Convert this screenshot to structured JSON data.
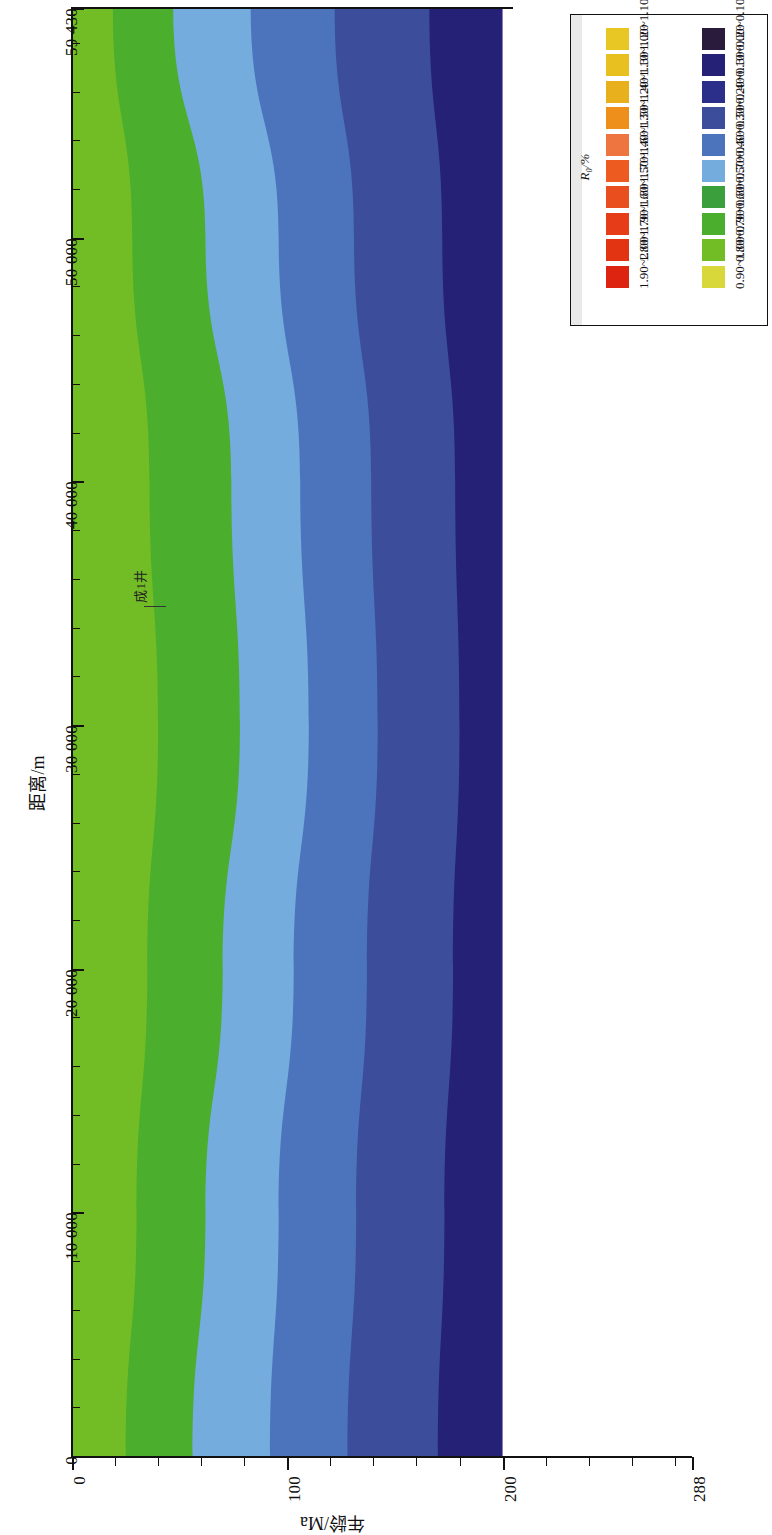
{
  "figure": {
    "kind": "filled-contour-map",
    "background": "#ffffff"
  },
  "axes": {
    "y": {
      "title": "距离/m",
      "unit": "m",
      "min": 0,
      "max": 59430,
      "tick_labels": [
        "0",
        "10 000",
        "20 000",
        "30 000",
        "40 000",
        "50 000",
        "59 430"
      ],
      "tick_values": [
        0,
        10000,
        20000,
        30000,
        40000,
        50000,
        59430
      ],
      "minor_tick_step": 2000
    },
    "x": {
      "title": "年龄/Ma",
      "unit": "Ma",
      "min": 0,
      "max": 288,
      "tick_labels": [
        "0",
        "100",
        "200",
        "288"
      ],
      "tick_values": [
        0,
        100,
        200,
        288
      ],
      "minor_tick_step": 20
    }
  },
  "annotations": [
    {
      "name": "well-marker",
      "label": "成1井",
      "distance_m": 37000
    }
  ],
  "legend": {
    "title": "R₀/%",
    "title_plain": "Ro/%",
    "columns": [
      {
        "name": "high-maturity-column",
        "entries": [
          {
            "label": "1.00~1.10",
            "color": "#E8C623"
          },
          {
            "label": "1.10~1.20",
            "color": "#E8C020"
          },
          {
            "label": "1.20~1.30",
            "color": "#E7B01C"
          },
          {
            "label": "1.30~1.40",
            "color": "#EE8F1C"
          },
          {
            "label": "1.40~1.50",
            "color": "#EE7540"
          },
          {
            "label": "1.50~1.60",
            "color": "#EE5B20"
          },
          {
            "label": "1.60~1.70",
            "color": "#E94E1E"
          },
          {
            "label": "1.70~1.80",
            "color": "#E63C18"
          },
          {
            "label": "1.80~1.90",
            "color": "#E23312"
          },
          {
            "label": "1.90~2.00",
            "color": "#DC2410"
          }
        ]
      },
      {
        "name": "low-maturity-column",
        "entries": [
          {
            "label": "0.00~0.10",
            "color": "#2A1B3D"
          },
          {
            "label": "0.10~0.20",
            "color": "#252176"
          },
          {
            "label": "0.20~0.30",
            "color": "#2B2F89"
          },
          {
            "label": "0.30~0.40",
            "color": "#3C4E9B"
          },
          {
            "label": "0.40~0.50",
            "color": "#4B74BD"
          },
          {
            "label": "0.50~0.60",
            "color": "#74ACDE"
          },
          {
            "label": "0.60~0.70",
            "color": "#3BA03B"
          },
          {
            "label": "0.70~0.80",
            "color": "#4BAE2C"
          },
          {
            "label": "0.80~0.90",
            "color": "#72BC26"
          },
          {
            "label": "0.90~1.00",
            "color": "#D9D83A"
          }
        ]
      }
    ]
  },
  "chart_data": {
    "type": "heatmap",
    "title": "",
    "subtitle": "",
    "xlabel": "年龄/Ma",
    "ylabel": "距离/m",
    "xlim": [
      0,
      288
    ],
    "ylim": [
      0,
      59430
    ],
    "grid": false,
    "legend_position": "top-right",
    "colorbar_label": "R₀/%",
    "note": "Contour bands run sub-vertically; each band boundary is an Ro iso-line whose Age position varies with Distance.",
    "bands": [
      {
        "name": "band-green-yellow",
        "range_label": "0.80~0.90",
        "color": "#72BC26",
        "x_left_Ma": 0,
        "x_right_by_distance": [
          {
            "distance_m": 59430,
            "age_Ma": 19
          },
          {
            "distance_m": 50000,
            "age_Ma": 28
          },
          {
            "distance_m": 40000,
            "age_Ma": 36
          },
          {
            "distance_m": 30000,
            "age_Ma": 40
          },
          {
            "distance_m": 20000,
            "age_Ma": 35
          },
          {
            "distance_m": 10000,
            "age_Ma": 30
          },
          {
            "distance_m": 0,
            "age_Ma": 25
          }
        ]
      },
      {
        "name": "band-green",
        "range_label": "0.70~0.80",
        "color": "#4BAE2C",
        "x_right_by_distance": [
          {
            "distance_m": 59430,
            "age_Ma": 47
          },
          {
            "distance_m": 50000,
            "age_Ma": 62
          },
          {
            "distance_m": 40000,
            "age_Ma": 74
          },
          {
            "distance_m": 30000,
            "age_Ma": 78
          },
          {
            "distance_m": 20000,
            "age_Ma": 70
          },
          {
            "distance_m": 10000,
            "age_Ma": 62
          },
          {
            "distance_m": 0,
            "age_Ma": 56
          }
        ]
      },
      {
        "name": "band-light-blue",
        "range_label": "0.50~0.60",
        "color": "#74ACDE",
        "x_right_by_distance": [
          {
            "distance_m": 59430,
            "age_Ma": 83
          },
          {
            "distance_m": 50000,
            "age_Ma": 96
          },
          {
            "distance_m": 40000,
            "age_Ma": 106
          },
          {
            "distance_m": 30000,
            "age_Ma": 110
          },
          {
            "distance_m": 20000,
            "age_Ma": 103
          },
          {
            "distance_m": 10000,
            "age_Ma": 96
          },
          {
            "distance_m": 0,
            "age_Ma": 92
          }
        ]
      },
      {
        "name": "band-medium-blue",
        "range_label": "0.40~0.50",
        "color": "#4B74BD",
        "x_right_by_distance": [
          {
            "distance_m": 59430,
            "age_Ma": 122
          },
          {
            "distance_m": 50000,
            "age_Ma": 131
          },
          {
            "distance_m": 40000,
            "age_Ma": 139
          },
          {
            "distance_m": 30000,
            "age_Ma": 142
          },
          {
            "distance_m": 20000,
            "age_Ma": 137
          },
          {
            "distance_m": 10000,
            "age_Ma": 132
          },
          {
            "distance_m": 0,
            "age_Ma": 128
          }
        ]
      },
      {
        "name": "band-dark-blue",
        "range_label": "0.30~0.40",
        "color": "#3C4E9B",
        "x_right_by_distance": [
          {
            "distance_m": 59430,
            "age_Ma": 166
          },
          {
            "distance_m": 50000,
            "age_Ma": 172
          },
          {
            "distance_m": 40000,
            "age_Ma": 178
          },
          {
            "distance_m": 30000,
            "age_Ma": 180
          },
          {
            "distance_m": 20000,
            "age_Ma": 177
          },
          {
            "distance_m": 10000,
            "age_Ma": 173
          },
          {
            "distance_m": 0,
            "age_Ma": 170
          }
        ]
      },
      {
        "name": "band-navy",
        "range_label": "0.10~0.20",
        "color": "#252176",
        "x_right_by_distance": [
          {
            "distance_m": 59430,
            "age_Ma": 200
          },
          {
            "distance_m": 0,
            "age_Ma": 200
          }
        ]
      }
    ]
  }
}
